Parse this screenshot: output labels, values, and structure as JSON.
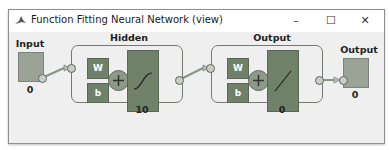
{
  "window": {
    "title": "Function Fitting Neural Network (view)",
    "controls": {
      "minimize": "–",
      "maximize": "☐",
      "close": "✕"
    }
  },
  "diagram": {
    "input": {
      "label": "Input",
      "size": "0"
    },
    "hidden": {
      "label": "Hidden",
      "weight": "W",
      "bias": "b",
      "size": "10",
      "transfer": "sigmoid"
    },
    "output_layer": {
      "label": "Output",
      "weight": "W",
      "bias": "b",
      "size": "0",
      "transfer": "linear"
    },
    "output": {
      "label": "Output",
      "size": "0"
    }
  },
  "colors": {
    "block": "#6f8169",
    "io": "#9aa396",
    "background": "#efefef"
  }
}
